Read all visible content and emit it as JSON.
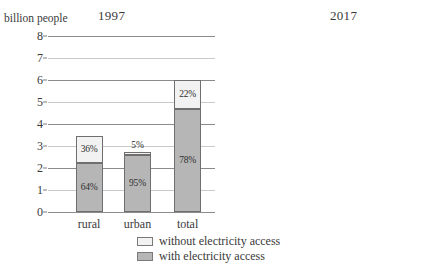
{
  "axis_caption": "billion people",
  "legend": {
    "items": [
      {
        "key": "without",
        "label": "without electricity access",
        "color": "#f2f2f2"
      },
      {
        "key": "with",
        "label": "with electricity access",
        "color": "#b6b6b6"
      }
    ]
  },
  "yticks": [
    "0",
    "1",
    "2",
    "3",
    "4",
    "5",
    "6",
    "7",
    "8"
  ],
  "chart_data": {
    "type": "bar",
    "subtype": "stacked",
    "xlabel": "",
    "ylabel": "billion people",
    "ylim": [
      0,
      8
    ],
    "ytick_values": [
      0,
      1,
      2,
      3,
      4,
      5,
      6,
      7,
      8
    ],
    "grid": true,
    "legend_position": "bottom-center",
    "categories": [
      "rural",
      "urban",
      "total"
    ],
    "panels": [
      {
        "title": "1997",
        "bars": [
          {
            "category": "rural",
            "total": 3.45,
            "segments": [
              {
                "name": "with electricity access",
                "percent_label": "64%",
                "percent": 64,
                "value": 2.21
              },
              {
                "name": "without electricity access",
                "percent_label": "36%",
                "percent": 36,
                "value": 1.24
              }
            ]
          },
          {
            "category": "urban",
            "total": 2.73,
            "segments": [
              {
                "name": "with electricity access",
                "percent_label": "95%",
                "percent": 95,
                "value": 2.59
              },
              {
                "name": "without electricity access",
                "percent_label": "5%",
                "percent": 5,
                "value": 0.14
              }
            ]
          },
          {
            "category": "total",
            "total": 6.0,
            "segments": [
              {
                "name": "with electricity access",
                "percent_label": "78%",
                "percent": 78,
                "value": 4.68
              },
              {
                "name": "without electricity access",
                "percent_label": "22%",
                "percent": 22,
                "value": 1.32
              }
            ]
          }
        ]
      },
      {
        "title": "2017",
        "bars": [
          {
            "category": "rural",
            "total": 3.55,
            "segments": [
              {
                "name": "with electricity access",
                "percent_label": "79%",
                "percent": 79,
                "value": 2.8
              },
              {
                "name": "without electricity access",
                "percent_label": "21%",
                "percent": 21,
                "value": 0.75
              }
            ]
          },
          {
            "category": "urban",
            "total": 4.0,
            "segments": [
              {
                "name": "with electricity access",
                "percent_label": "97%",
                "percent": 97,
                "value": 3.88
              },
              {
                "name": "without electricity access",
                "percent_label": "3%",
                "percent": 3,
                "value": 0.12
              }
            ]
          },
          {
            "category": "total",
            "total": 7.25,
            "segments": [
              {
                "name": "with electricity access",
                "percent_label": "89%",
                "percent": 89,
                "value": 6.45
              },
              {
                "name": "without electricity access",
                "percent_label": "11%",
                "percent": 11,
                "value": 0.8
              }
            ]
          }
        ]
      }
    ]
  }
}
